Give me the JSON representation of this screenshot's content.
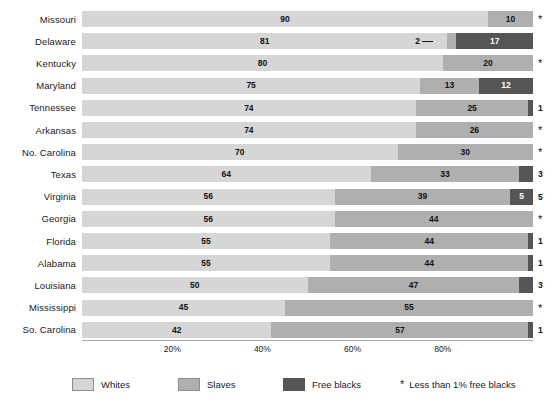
{
  "chart_data": {
    "type": "bar",
    "orientation": "horizontal",
    "stacked": true,
    "title": "",
    "xlabel": "",
    "ylabel": "",
    "xlim": [
      0,
      100
    ],
    "grid": false,
    "legend_position": "bottom",
    "categories": [
      "Missouri",
      "Delaware",
      "Kentucky",
      "Maryland",
      "Tennessee",
      "Arkansas",
      "No. Carolina",
      "Texas",
      "Virginia",
      "Georgia",
      "Florida",
      "Alabama",
      "Louisiana",
      "Mississippi",
      "So. Carolina"
    ],
    "series": [
      {
        "name": "Whites",
        "color": "#d6d6d6",
        "values": [
          90,
          81,
          80,
          75,
          74,
          74,
          70,
          64,
          56,
          56,
          55,
          55,
          50,
          45,
          42
        ]
      },
      {
        "name": "Slaves",
        "color": "#afafaf",
        "values": [
          10,
          2,
          20,
          13,
          25,
          26,
          30,
          33,
          39,
          44,
          44,
          44,
          47,
          55,
          57
        ]
      },
      {
        "name": "Free blacks",
        "color": "#555555",
        "values": [
          0,
          17,
          0,
          12,
          1,
          0,
          0,
          3,
          5,
          0,
          1,
          1,
          3,
          0,
          1
        ]
      }
    ],
    "end_markers": [
      "*",
      "",
      "*",
      "",
      "1",
      "*",
      "*",
      "3",
      "5",
      "*",
      "1",
      "1",
      "3",
      "*",
      "1"
    ],
    "xticks": [
      20,
      40,
      60,
      80
    ],
    "xticklabels": [
      "20%",
      "40%",
      "60%",
      "80%"
    ],
    "annotations": [
      {
        "row": "Delaware",
        "text": "2",
        "series": "Slaves",
        "style": "leader-line"
      }
    ]
  },
  "legend": {
    "items": [
      {
        "label": "Whites",
        "color": "#d6d6d6"
      },
      {
        "label": "Slaves",
        "color": "#afafaf"
      },
      {
        "label": "Free blacks",
        "color": "#555555"
      }
    ],
    "note": {
      "symbol": "*",
      "text": "Less than 1% free blacks"
    }
  }
}
